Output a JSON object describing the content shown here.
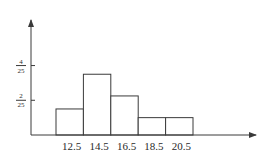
{
  "chart_data": {
    "type": "bar",
    "title": "",
    "xlabel": "",
    "ylabel": "",
    "categories": [
      "12.5",
      "14.5",
      "16.5",
      "18.5",
      "20.5"
    ],
    "values": [
      0.06,
      0.14,
      0.09,
      0.04,
      0.04
    ],
    "ylim": [
      0,
      0.2
    ],
    "y_ticks": [
      {
        "value": 0.08,
        "numerator": "2",
        "denominator": "25"
      },
      {
        "value": 0.16,
        "numerator": "4",
        "denominator": "25"
      }
    ],
    "bar_style": "histogram, adjacent bars, white fill, black outline",
    "grid": false,
    "legend": null
  },
  "colors": {
    "stroke": "#3a3a3a",
    "fill": "#ffffff",
    "text": "#2a2a2a"
  }
}
